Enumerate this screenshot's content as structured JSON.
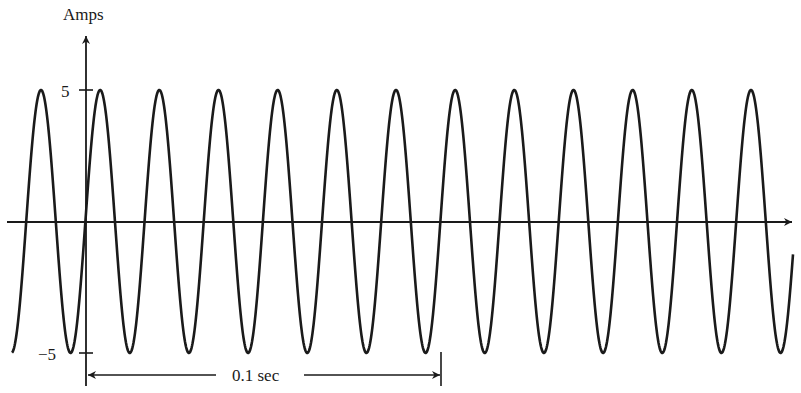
{
  "chart_data": {
    "type": "line",
    "title": "",
    "ylabel": "Amps",
    "xlabel": "",
    "y_ticks": [
      {
        "value": 5,
        "label": "5"
      },
      {
        "value": -5,
        "label": "−5"
      }
    ],
    "ylim": [
      -5,
      5
    ],
    "grid": false,
    "legend": null,
    "series": [
      {
        "name": "AC current",
        "function": "sine",
        "amplitude": 5,
        "frequency_hz": 60,
        "period_sec": 0.016667,
        "cycles_per_0_1_sec": 6
      }
    ],
    "annotations": [
      {
        "type": "interval-arrow",
        "label": "0.1 sec",
        "from_t": 0,
        "to_t": 0.1
      }
    ]
  },
  "labels": {
    "y_axis": "Amps",
    "tick_pos": "5",
    "tick_neg": "−5",
    "interval": "0.1 sec"
  },
  "colors": {
    "ink": "#1a1a1a",
    "background": "#ffffff"
  }
}
